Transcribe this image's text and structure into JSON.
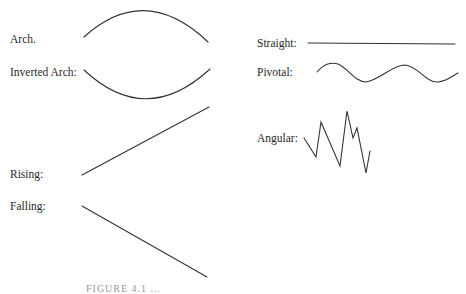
{
  "contours": [
    {
      "id": "arch",
      "label": "Arch.",
      "shape": "arch"
    },
    {
      "id": "inverted-arch",
      "label": "Inverted Arch:",
      "shape": "inverted-arch"
    },
    {
      "id": "rising",
      "label": "Rising:",
      "shape": "rising"
    },
    {
      "id": "falling",
      "label": "Falling:",
      "shape": "falling"
    },
    {
      "id": "straight",
      "label": "Straight:",
      "shape": "straight"
    },
    {
      "id": "pivotal",
      "label": "Pivotal:",
      "shape": "pivotal"
    },
    {
      "id": "angular",
      "label": "Angular:",
      "shape": "angular"
    }
  ],
  "caption": "FIGURE 4.1 ...",
  "colors": {
    "line": "#333333",
    "text": "#2a2a2a",
    "background": "#ffffff"
  }
}
